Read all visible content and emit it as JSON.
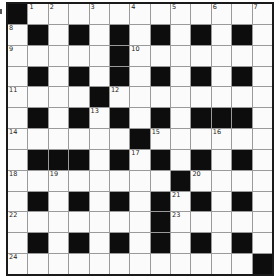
{
  "puzzle": {
    "rows": 13,
    "cols": 13,
    "layout": [
      "#............",
      ".#.#.#.#.#.#.",
      ".....#.......",
      ".#.#.#.#.#.#.",
      "....#........",
      ".#.#.#.#.###.",
      "......#......",
      ".###.#.#.#.#.",
      "........#....",
      ".#.#.#.#.#.#.",
      ".......#.....",
      ".#.#.#.#.#.#.",
      "............#"
    ],
    "numbers": [
      {
        "row": 0,
        "col": 1,
        "n": "1"
      },
      {
        "row": 0,
        "col": 2,
        "n": "2"
      },
      {
        "row": 0,
        "col": 4,
        "n": "3"
      },
      {
        "row": 0,
        "col": 6,
        "n": "4"
      },
      {
        "row": 0,
        "col": 8,
        "n": "5"
      },
      {
        "row": 0,
        "col": 10,
        "n": "6"
      },
      {
        "row": 0,
        "col": 12,
        "n": "7"
      },
      {
        "row": 1,
        "col": 0,
        "n": "8"
      },
      {
        "row": 2,
        "col": 0,
        "n": "9"
      },
      {
        "row": 2,
        "col": 6,
        "n": "10"
      },
      {
        "row": 4,
        "col": 0,
        "n": "11"
      },
      {
        "row": 4,
        "col": 5,
        "n": "12"
      },
      {
        "row": 5,
        "col": 4,
        "n": "13"
      },
      {
        "row": 6,
        "col": 0,
        "n": "14"
      },
      {
        "row": 6,
        "col": 7,
        "n": "15"
      },
      {
        "row": 6,
        "col": 10,
        "n": "16"
      },
      {
        "row": 7,
        "col": 6,
        "n": "17"
      },
      {
        "row": 8,
        "col": 0,
        "n": "18"
      },
      {
        "row": 8,
        "col": 2,
        "n": "19"
      },
      {
        "row": 8,
        "col": 9,
        "n": "20"
      },
      {
        "row": 9,
        "col": 8,
        "n": "21"
      },
      {
        "row": 10,
        "col": 0,
        "n": "22"
      },
      {
        "row": 10,
        "col": 8,
        "n": "23"
      },
      {
        "row": 12,
        "col": 0,
        "n": "24"
      }
    ]
  },
  "colors": {
    "block": "#0d0d0d",
    "empty": "#fbfbfb",
    "gridline": "#9a9a9a"
  }
}
